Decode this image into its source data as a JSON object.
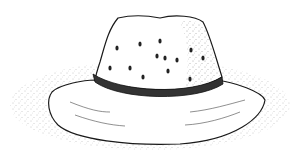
{
  "image": {
    "subject": "stippled ink drawing of a wide-brim hat with ventilation holes and a band",
    "background_color": "#ffffff",
    "ink_color": "#1a1a1a"
  }
}
